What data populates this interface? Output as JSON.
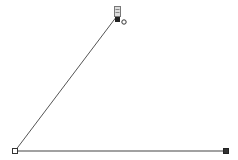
{
  "diagram": {
    "shape": "angle",
    "line_color": "#555555",
    "points": {
      "apex": {
        "x": 117,
        "y": 16
      },
      "left": {
        "x": 15,
        "y": 151
      },
      "right": {
        "x": 226,
        "y": 151
      }
    },
    "handles": {
      "left_endpoint": {
        "style": "hollow-square"
      },
      "right_endpoint": {
        "style": "filled-square"
      },
      "apex_move": {
        "style": "grip-icon"
      },
      "apex_rotate": {
        "style": "circle"
      }
    }
  }
}
